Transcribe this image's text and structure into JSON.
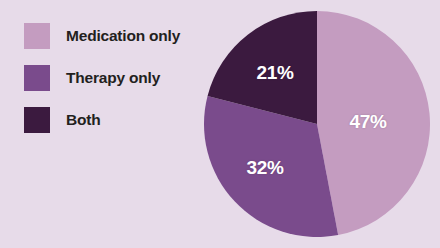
{
  "figure": {
    "background_color": "#e7dbe9",
    "text_color": "#231f20",
    "label_color": "#ffffff"
  },
  "legend": {
    "items": [
      {
        "label": "Medication only",
        "color": "#c49cc0",
        "swatch_name": "legend-swatch-medication-only"
      },
      {
        "label": "Therapy only",
        "color": "#7a4b8c",
        "swatch_name": "legend-swatch-therapy-only"
      },
      {
        "label": "Both",
        "color": "#3b1a3f",
        "swatch_name": "legend-swatch-both"
      }
    ]
  },
  "pie": {
    "center_x": 113,
    "center_y": 113,
    "radius": 113,
    "start_angle_deg": 0,
    "direction": "clockwise",
    "label_radius_fraction": 0.56,
    "labels": [
      {
        "text": "47%",
        "x": 164,
        "y": 111
      },
      {
        "text": "32%",
        "x": 61,
        "y": 157
      },
      {
        "text": "21%",
        "x": 71,
        "y": 62
      }
    ]
  },
  "chart_data": {
    "type": "pie",
    "title": "",
    "categories": [
      "Medication only",
      "Therapy only",
      "Both"
    ],
    "values": [
      47,
      32,
      21
    ],
    "value_unit": "%",
    "data_labels": [
      "47%",
      "32%",
      "21%"
    ],
    "colors": [
      "#c49cc0",
      "#7a4b8c",
      "#3b1a3f"
    ],
    "legend": [
      "Medication only",
      "Therapy only",
      "Both"
    ],
    "legend_position": "left",
    "grid": false,
    "xlabel": "",
    "ylabel": "",
    "start_angle_deg": 90,
    "counterclock": false,
    "total": 100
  }
}
